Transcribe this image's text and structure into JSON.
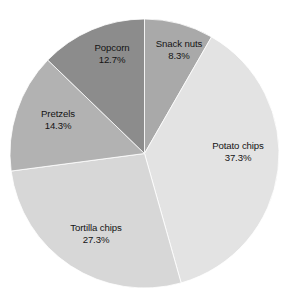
{
  "chart_data": {
    "type": "pie",
    "title": "",
    "subtitle": "",
    "xlabel": "",
    "ylabel": "",
    "legend_position": "none",
    "grid": false,
    "start_angle_deg": 0,
    "direction": "clockwise",
    "unit": "%",
    "categories": [
      "Snack nuts",
      "Potato chips",
      "Tortilla chips",
      "Pretzels",
      "Popcorn"
    ],
    "values": [
      8.3,
      37.3,
      27.3,
      14.3,
      12.7
    ],
    "total": 99.9,
    "slices": [
      {
        "label": "Snack nuts",
        "value": 8.3,
        "value_text": "8.3%",
        "color": "#a9a9a9",
        "start_deg": 0,
        "end_deg": 29.9
      },
      {
        "label": "Potato chips",
        "value": 37.3,
        "value_text": "37.3%",
        "color": "#e3e3e3",
        "start_deg": 29.9,
        "end_deg": 164.2
      },
      {
        "label": "Tortilla chips",
        "value": 27.3,
        "value_text": "27.3%",
        "color": "#d7d7d7",
        "start_deg": 164.2,
        "end_deg": 262.5
      },
      {
        "label": "Pretzels",
        "value": 14.3,
        "value_text": "14.3%",
        "color": "#b2b2b2",
        "start_deg": 262.5,
        "end_deg": 314.0
      },
      {
        "label": "Popcorn",
        "value": 12.7,
        "value_text": "12.7%",
        "color": "#8c8c8c",
        "start_deg": 314.0,
        "end_deg": 360
      }
    ],
    "geometry": {
      "center_x": 144.5,
      "center_y": 153.5,
      "radius": 134.5
    },
    "colors": {
      "background": "#ffffff",
      "label_text": "#141414",
      "slice_edge": "#ffffff"
    }
  }
}
